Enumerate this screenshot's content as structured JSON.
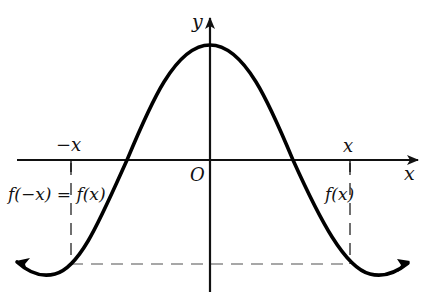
{
  "diagram": {
    "colors": {
      "curve": "#000000",
      "axes": "#111111",
      "dashed": "#8a8a8a",
      "text": "#111111"
    },
    "axes": {
      "x_label": "x",
      "y_label": "y",
      "origin_label": "O"
    },
    "ticks": {
      "neg_x_label": "−x",
      "pos_x_label": "x"
    },
    "annotations": {
      "left_value": "f(−x) = f(x)",
      "right_value": "f(x)"
    }
  }
}
